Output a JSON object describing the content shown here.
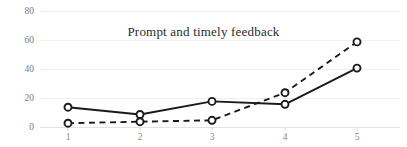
{
  "chart_data": {
    "type": "line",
    "title": "Prompt and timely feedback",
    "xlabel": "",
    "ylabel": "",
    "categories": [
      "1",
      "2",
      "3",
      "4",
      "5"
    ],
    "yticks": [
      "0",
      "20",
      "40",
      "60",
      "80"
    ],
    "ylim": [
      0,
      80
    ],
    "grid": true,
    "legend": "none",
    "series": [
      {
        "name": "series-solid",
        "style": "solid",
        "marker": "open-circle",
        "color": "#1a1a1a",
        "values": [
          14,
          9,
          18,
          16,
          41
        ]
      },
      {
        "name": "series-dashed",
        "style": "dashed",
        "marker": "open-circle",
        "color": "#1a1a1a",
        "values": [
          3,
          4,
          5,
          24,
          59
        ]
      }
    ]
  }
}
